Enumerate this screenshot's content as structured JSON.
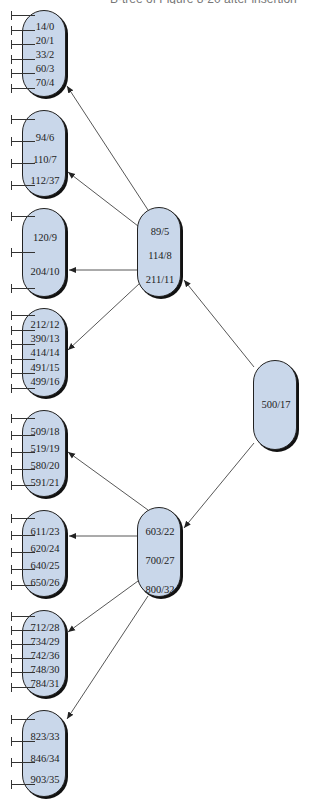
{
  "caption": "B-tree of Figure 8-20 after insertion",
  "colors": {
    "node_fill": "#c9d7ea",
    "node_border": "#222222",
    "edge": "#444444"
  },
  "tree": {
    "root": {
      "keys": [
        "500/17"
      ]
    },
    "internal": [
      {
        "keys": [
          "89/5",
          "114/8",
          "211/11"
        ]
      },
      {
        "keys": [
          "603/22",
          "700/27",
          "800/32"
        ]
      }
    ],
    "leaves": [
      {
        "keys": [
          "14/0",
          "20/1",
          "33/2",
          "60/3",
          "70/4"
        ]
      },
      {
        "keys": [
          "94/6",
          "110/7",
          "112/37"
        ]
      },
      {
        "keys": [
          "120/9",
          "204/10"
        ]
      },
      {
        "keys": [
          "212/12",
          "390/13",
          "414/14",
          "491/15",
          "499/16"
        ]
      },
      {
        "keys": [
          "509/18",
          "519/19",
          "580/20",
          "591/21"
        ]
      },
      {
        "keys": [
          "611/23",
          "620/24",
          "640/25",
          "650/26"
        ]
      },
      {
        "keys": [
          "712/28",
          "734/29",
          "742/36",
          "748/30",
          "784/31"
        ]
      },
      {
        "keys": [
          "823/33",
          "846/34",
          "903/35"
        ]
      }
    ]
  }
}
